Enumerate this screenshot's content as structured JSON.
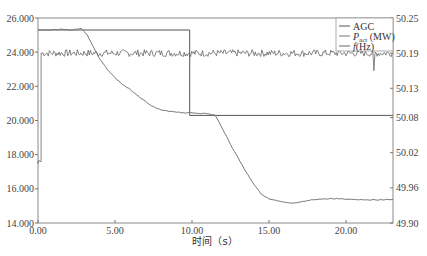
{
  "chart_data": {
    "type": "line",
    "title": "",
    "xlabel": "时间（s）",
    "ylabel_left": "",
    "ylabel_right": "",
    "xlim": [
      0,
      23.05
    ],
    "ylim_left": [
      14.0,
      26.0
    ],
    "ylim_right": [
      49.9,
      50.25
    ],
    "x_ticks": [
      "0.00",
      "5.00",
      "10.00",
      "15.00",
      "20.00"
    ],
    "x_tick_values": [
      0,
      5,
      10,
      15,
      20
    ],
    "y_left_ticks": [
      "14.000",
      "16.000",
      "18.000",
      "20.000",
      "22.000",
      "24.000",
      "26.000"
    ],
    "y_left_tick_values": [
      14,
      16,
      18,
      20,
      22,
      24,
      26
    ],
    "y_right_ticks": [
      "49.90",
      "49.96",
      "50.02",
      "50.08",
      "50.13",
      "50.19",
      "50.25"
    ],
    "y_right_tick_values": [
      49.9,
      49.96,
      50.02,
      50.08,
      50.13,
      50.19,
      50.25
    ],
    "grid": false,
    "legend_position": "upper right",
    "legend": [
      {
        "label": "AGC",
        "sub": "",
        "suffix": ""
      },
      {
        "label": "P",
        "sub": "act",
        "suffix": " (MW)"
      },
      {
        "label": "f",
        "sub": "",
        "suffix": "(Hz)"
      }
    ],
    "series": [
      {
        "name": "AGC",
        "axis": "left",
        "color": "#555555",
        "x": [
          0,
          9.85,
          9.85,
          23.05
        ],
        "values": [
          25.3,
          25.3,
          20.3,
          20.3
        ]
      },
      {
        "name": "P_act (MW)",
        "axis": "left",
        "color": "#777777",
        "x": [
          0,
          0.5,
          1.0,
          1.5,
          2.0,
          2.5,
          2.8,
          3.2,
          3.6,
          4.0,
          4.5,
          5.0,
          5.5,
          6.0,
          6.5,
          7.0,
          7.5,
          8.0,
          8.5,
          9.0,
          9.5,
          10.0,
          10.5,
          11.0,
          11.5,
          12.0,
          12.5,
          13.0,
          13.5,
          14.0,
          14.5,
          15.0,
          15.5,
          16.0,
          16.5,
          17.0,
          17.5,
          18.0,
          18.5,
          19.0,
          19.5,
          20.0,
          20.5,
          21.0,
          21.5,
          22.0,
          22.5,
          23.05
        ],
        "values": [
          25.3,
          25.3,
          25.32,
          25.35,
          25.3,
          25.33,
          25.4,
          25.0,
          24.3,
          23.6,
          23.0,
          22.5,
          22.1,
          21.8,
          21.45,
          21.1,
          20.8,
          20.6,
          20.55,
          20.5,
          20.45,
          20.45,
          20.42,
          20.4,
          20.3,
          19.5,
          18.6,
          17.8,
          17.0,
          16.3,
          15.7,
          15.4,
          15.3,
          15.2,
          15.15,
          15.2,
          15.3,
          15.38,
          15.4,
          15.42,
          15.42,
          15.4,
          15.38,
          15.37,
          15.36,
          15.36,
          15.37,
          15.38
        ]
      },
      {
        "name": "f (Hz)",
        "axis": "right",
        "color": "#666666",
        "x": [
          0,
          0.2,
          0.2,
          23.05
        ],
        "values": [
          50.005,
          50.005,
          50.19,
          50.19
        ],
        "noise_amplitude_hz": 0.006,
        "note": "frequency fluctuates around 50.19 Hz after 0.2 s; brief dip near 21.8 s"
      }
    ]
  }
}
